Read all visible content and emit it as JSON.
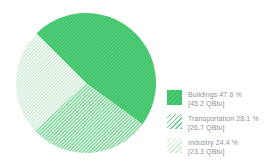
{
  "chart_data": {
    "type": "pie",
    "title": "",
    "legend_position": "right",
    "start_angle_deg": -45,
    "unit": "QBtu",
    "text_color": "#8d9397",
    "background_color": "#ffffff",
    "categories": [
      "Buildings",
      "Transportation",
      "Industry"
    ],
    "values_percent": [
      47.6,
      28.1,
      24.4
    ],
    "values_qbtu": [
      45.2,
      26.7,
      23.3
    ],
    "slices": [
      {
        "name": "Buildings",
        "percent": 47.6,
        "value_qbtu": 45.2,
        "legend_label": "Buildings 47.6 %",
        "legend_sublabel": "[45.2 QBtu]",
        "pattern": "dense-green-hatch",
        "base_color": "#3cc368",
        "hatch_line_color": "#61d184"
      },
      {
        "name": "Transportation",
        "percent": 28.1,
        "value_qbtu": 26.7,
        "legend_label": "Transportation 28.1 %",
        "legend_sublabel": "[26.7 QBtu]",
        "pattern": "medium-green-hatch",
        "base_color": "#f4fbf6",
        "hatch_line_color": "#6fd08e"
      },
      {
        "name": "Industry",
        "percent": 24.4,
        "value_qbtu": 23.3,
        "legend_label": "Industry 24.4 %",
        "legend_sublabel": "[23.3 QBtu]",
        "pattern": "light-green-hatch",
        "base_color": "#fcfefc",
        "hatch_line_color": "#cbe9d4"
      }
    ]
  }
}
